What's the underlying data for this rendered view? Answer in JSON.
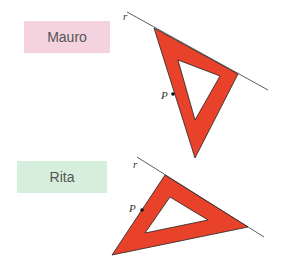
{
  "labels": {
    "mauro": "Mauro",
    "rita": "Rita"
  },
  "figures": {
    "mauro": {
      "line_label": "r",
      "point_label": "P"
    },
    "rita": {
      "line_label": "r",
      "point_label": "P"
    }
  },
  "colors": {
    "triangle_fill": "#e8432a",
    "line": "#333333"
  }
}
